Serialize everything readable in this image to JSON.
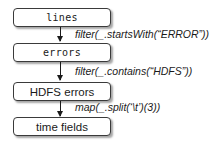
{
  "diagram": {
    "type": "flowchart",
    "direction": "top-to-bottom",
    "nodes": [
      {
        "id": "lines",
        "label": "lines",
        "font": "mono"
      },
      {
        "id": "errors",
        "label": "errors",
        "font": "mono"
      },
      {
        "id": "hdfs_errors",
        "label": "HDFS errors",
        "font": "sans"
      },
      {
        "id": "time_fields",
        "label": "time fields",
        "font": "sans"
      }
    ],
    "edges": [
      {
        "from": "lines",
        "to": "errors",
        "label": "filter(_.startsWith(“ERROR”))"
      },
      {
        "from": "errors",
        "to": "hdfs_errors",
        "label": "filter(_.contains(“HDFS”))"
      },
      {
        "from": "hdfs_errors",
        "to": "time_fields",
        "label": "map(_.split(‘\\t’)(3))"
      }
    ]
  },
  "colors": {
    "border": "#3a3a3a",
    "text": "#1a1a1a",
    "background": "#ffffff"
  }
}
